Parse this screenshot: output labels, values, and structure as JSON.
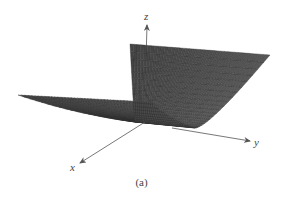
{
  "figure": {
    "caption": "(a)"
  },
  "axes": {
    "x": {
      "label": "x"
    },
    "y": {
      "label": "y"
    },
    "z": {
      "label": "z"
    }
  },
  "colors": {
    "surface": "#5a5a5a",
    "mesh": "#2e2e2e",
    "axis": "#555555",
    "label": "#444444"
  },
  "chart_data": {
    "type": "surface",
    "title": "",
    "equation": "z = x^2",
    "xlabel": "x",
    "ylabel": "y",
    "zlabel": "z",
    "x_range": [
      -1,
      1
    ],
    "y_range": [
      0,
      1
    ],
    "grid": {
      "x_divisions": 40,
      "y_divisions": 40
    },
    "caption": "(a)"
  }
}
